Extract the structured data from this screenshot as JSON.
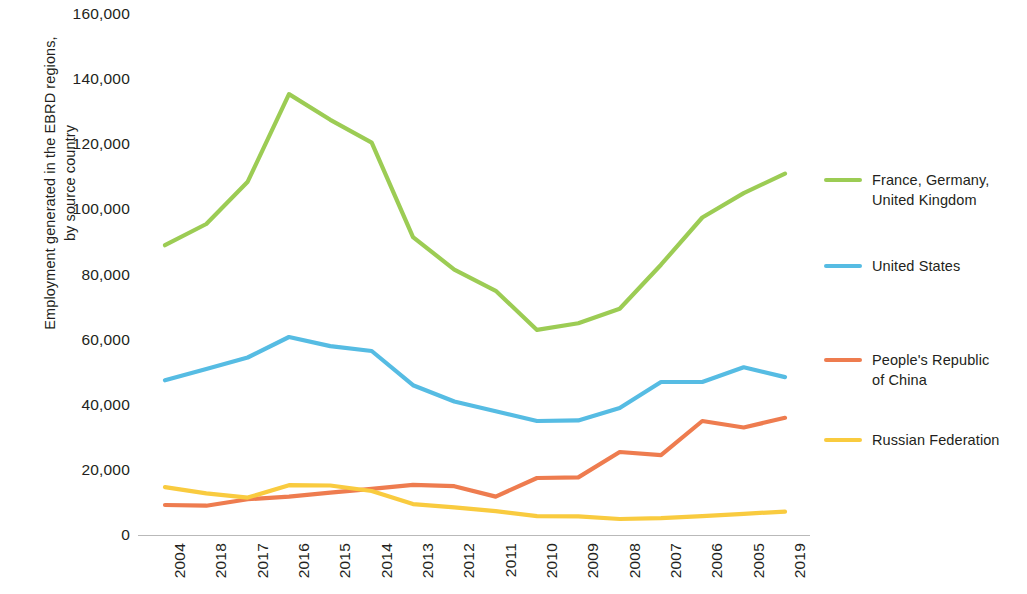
{
  "chart_data": {
    "type": "line",
    "title": "",
    "xlabel": "",
    "ylabel": "Employment generated in the EBRD regions, by source country",
    "ylabel_line1": "Employment generated in the EBRD regions,",
    "ylabel_line2": "by source country",
    "categories": [
      "2004",
      "2018",
      "2017",
      "2016",
      "2015",
      "2014",
      "2013",
      "2012",
      "2011",
      "2010",
      "2009",
      "2008",
      "2007",
      "2006",
      "2005",
      "2019"
    ],
    "ylim": [
      0,
      160000
    ],
    "yticks": [
      0,
      20000,
      40000,
      60000,
      80000,
      100000,
      120000,
      140000,
      160000
    ],
    "ytick_labels": [
      "0",
      "20,000",
      "40,000",
      "60,000",
      "80,000",
      "100,000",
      "120,000",
      "140,000",
      "160,000"
    ],
    "grid": false,
    "legend_position": "right",
    "series": [
      {
        "name": "France, Germany, United Kingdom",
        "color": "#9CCC54",
        "values": [
          89000,
          95500,
          108500,
          135400,
          127500,
          120500,
          91500,
          81500,
          75000,
          63000,
          65000,
          69500,
          83000,
          97500,
          105000,
          111000
        ]
      },
      {
        "name": "United States",
        "color": "#56BCE3",
        "values": [
          47500,
          51000,
          54500,
          60800,
          58000,
          56500,
          46000,
          41000,
          38000,
          35000,
          35200,
          39000,
          47000,
          47000,
          51500,
          48500
        ]
      },
      {
        "name": "People's Republic of China",
        "color": "#EE7C4F",
        "values": [
          9200,
          9000,
          11000,
          11800,
          13000,
          14200,
          15400,
          15000,
          11800,
          17500,
          17700,
          25500,
          24500,
          35000,
          33000,
          36000
        ]
      },
      {
        "name": "Russian Federation",
        "color": "#F9CB3F",
        "values": [
          14700,
          12800,
          11500,
          15300,
          15200,
          13500,
          9500,
          8500,
          7300,
          5800,
          5700,
          4900,
          5200,
          5800,
          6500,
          7200
        ]
      }
    ]
  },
  "legend": {
    "items": [
      {
        "label_line1": "France, Germany,",
        "label_line2": "United Kingdom",
        "color": "#9CCC54"
      },
      {
        "label_line1": "United States",
        "label_line2": "",
        "color": "#56BCE3"
      },
      {
        "label_line1": "People's Republic",
        "label_line2": "of China",
        "color": "#EE7C4F"
      },
      {
        "label_line1": "Russian Federation",
        "label_line2": "",
        "color": "#F9CB3F"
      }
    ]
  },
  "axis": {
    "line_color": "#b9b9b9"
  }
}
